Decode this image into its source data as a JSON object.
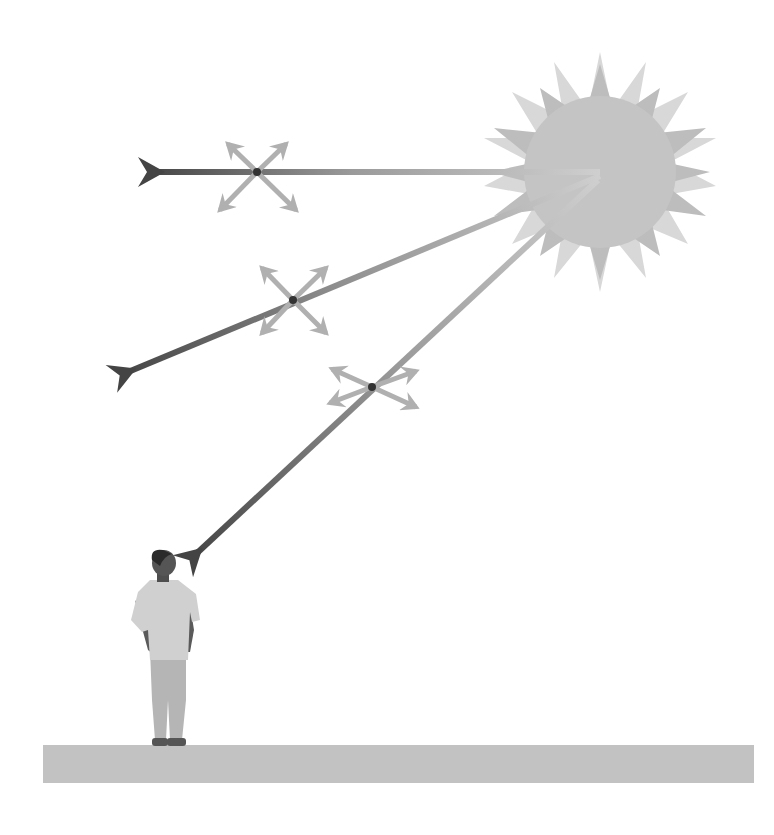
{
  "diagram": {
    "colors": {
      "background": "#ffffff",
      "sun_core": "#c4c4c4",
      "sun_rays_dark": "#bdbdbd",
      "sun_rays_light": "#d6d6d6",
      "ray_start": "#c8c8c8",
      "ray_end": "#4a4a4a",
      "polarization_cross": "#b0b0b0",
      "ground": "#c2c2c2",
      "person_shirt": "#cfcfcf",
      "person_pants": "#b8b8b8",
      "person_skin": "#555555",
      "person_hair": "#2e2e2e"
    },
    "sun": {
      "cx": 600,
      "cy": 172,
      "core_radius": 75,
      "points": 16
    },
    "rays": [
      {
        "name": "horizontal-ray",
        "from": [
          600,
          172
        ],
        "to": [
          148,
          172
        ],
        "cross_at": [
          257,
          172
        ]
      },
      {
        "name": "diagonal-ray",
        "from": [
          600,
          175
        ],
        "to": [
          120,
          375
        ],
        "cross_at": [
          293,
          300
        ]
      },
      {
        "name": "ray-to-observer",
        "from": [
          600,
          178
        ],
        "to": [
          190,
          560
        ],
        "cross_at": [
          375,
          387
        ]
      }
    ],
    "ground": {
      "x": 43,
      "y": 745,
      "width": 711,
      "height": 38
    },
    "observer": {
      "label": "person-looking-up"
    }
  }
}
